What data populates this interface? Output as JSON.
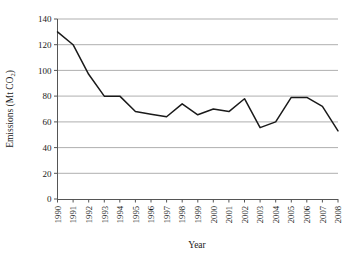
{
  "chart_data": {
    "type": "line",
    "title": "",
    "xlabel": "Year",
    "ylabel": "Emissions (Mt CO2)",
    "ylabel_main": "Emissions (Mt CO",
    "ylabel_sub": "2",
    "ylabel_close": ")",
    "categories": [
      "1990",
      "1991",
      "1992",
      "1993",
      "1994",
      "1995",
      "1996",
      "1997",
      "1998",
      "1999",
      "2000",
      "2001",
      "2002",
      "2003",
      "2004",
      "2005",
      "2006",
      "2007",
      "2008"
    ],
    "values": [
      130,
      120,
      97,
      80,
      80,
      68,
      66,
      64,
      74,
      65.5,
      70,
      68,
      78,
      55.5,
      60,
      79,
      79,
      72,
      53
    ],
    "x": [
      1990,
      1991,
      1992,
      1993,
      1994,
      1995,
      1996,
      1997,
      1998,
      1999,
      2000,
      2001,
      2002,
      2003,
      2004,
      2005,
      2006,
      2007,
      2008
    ],
    "ylim": [
      0,
      140
    ],
    "ytick_values": [
      0,
      20,
      40,
      60,
      80,
      100,
      120,
      140
    ],
    "ytick_labels": [
      "0",
      "20",
      "40",
      "60",
      "80",
      "100",
      "120",
      "140"
    ],
    "xlim": [
      1990,
      2008
    ],
    "grid": "horizontal",
    "legend": "none",
    "series_color": "#1a1a1a",
    "grid_color": "#a6a6a6",
    "axis_color": "#555555",
    "background": "#ffffff"
  }
}
